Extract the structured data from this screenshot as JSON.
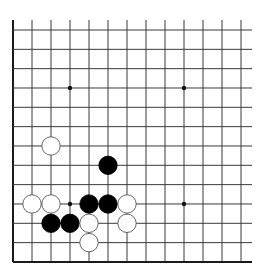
{
  "board": {
    "description": "Partial Go board diagram showing lower-left corner",
    "visible_columns": 13,
    "visible_rows": 13,
    "edges": {
      "left": true,
      "bottom": true,
      "top": false,
      "right": false
    },
    "origin_x": 13,
    "origin_y": 30,
    "spacing_x": 19.0,
    "spacing_y": 19.33,
    "line_color": "#3a3a3a",
    "edge_color": "#1a1a1a",
    "stone_radius": 9.2,
    "hoshi": [
      {
        "col": 3,
        "row": 3
      },
      {
        "col": 9,
        "row": 3
      },
      {
        "col": 3,
        "row": 9
      },
      {
        "col": 9,
        "row": 9
      }
    ],
    "stones": [
      {
        "color": "white",
        "col": 2,
        "row": 6
      },
      {
        "color": "black",
        "col": 5,
        "row": 7
      },
      {
        "color": "white",
        "col": 1,
        "row": 9
      },
      {
        "color": "white",
        "col": 2,
        "row": 9
      },
      {
        "color": "black",
        "col": 4,
        "row": 9
      },
      {
        "color": "black",
        "col": 5,
        "row": 9
      },
      {
        "color": "white",
        "col": 6,
        "row": 9
      },
      {
        "color": "black",
        "col": 2,
        "row": 10
      },
      {
        "color": "black",
        "col": 3,
        "row": 10
      },
      {
        "color": "white",
        "col": 4,
        "row": 10
      },
      {
        "color": "white",
        "col": 6,
        "row": 10
      },
      {
        "color": "white",
        "col": 4,
        "row": 11
      }
    ],
    "colors": {
      "black_stone": "#000000",
      "white_stone": "#ffffff",
      "white_stone_outline": "#555555",
      "background": "#ffffff"
    }
  }
}
